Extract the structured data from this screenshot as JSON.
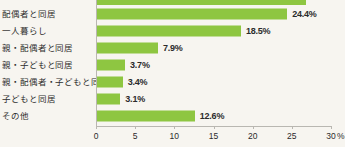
{
  "chart_data": {
    "type": "bar",
    "orientation": "horizontal",
    "title": "",
    "subtitle": "",
    "xlabel": "",
    "ylabel": "",
    "xlim": [
      0,
      30
    ],
    "x_unit": "%",
    "grid": false,
    "legend": null,
    "bar_color": "#8ec641",
    "axis_color": "#b9b7b1",
    "background_color": "#f7f5f0",
    "categories": [
      "配偶者と同居",
      "一人暮らし",
      "親・配偶者と同居",
      "親・子どもと同居",
      "親・配偶者・子どもと同居",
      "子どもと同居",
      "その他"
    ],
    "values": [
      24.4,
      18.5,
      7.9,
      3.7,
      3.4,
      3.1,
      12.6
    ],
    "value_labels": [
      "24.4%",
      "18.5%",
      "7.9%",
      "3.7%",
      "3.4%",
      "3.1%",
      "12.6%"
    ],
    "xticks": [
      0,
      5,
      10,
      15,
      20,
      25,
      30
    ],
    "xtick_labels": [
      "0",
      "5",
      "10",
      "15",
      "20",
      "25",
      "30"
    ],
    "clipped_top_bar": {
      "visible": true,
      "value": 26.8,
      "note": "bar from preceding row, cropped by image edge"
    }
  }
}
